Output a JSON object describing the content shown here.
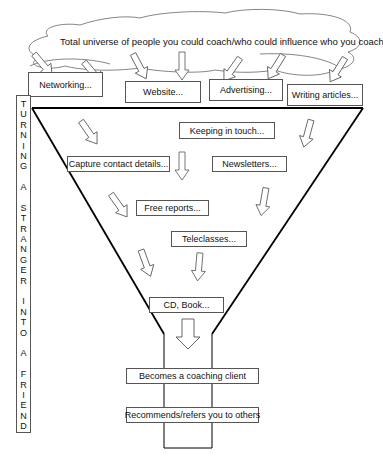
{
  "cloud": {
    "text": "Total universe of people you could coach/who could influence who you coach"
  },
  "channels": [
    {
      "label": "Networking..."
    },
    {
      "label": "Website..."
    },
    {
      "label": "Advertising..."
    },
    {
      "label": "Writing articles..."
    }
  ],
  "funnel_steps": {
    "keeping_in_touch": "Keeping in touch...",
    "capture_contact": "Capture contact details...",
    "newsletters": "Newsletters...",
    "free_reports": "Free reports...",
    "teleclasses": "Teleclasses...",
    "cd_book": "CD, Book...",
    "becomes_client": "Becomes a coaching client",
    "recommends": "Recommends/refers you to others"
  },
  "side_label": {
    "letters": [
      "T",
      "U",
      "R",
      "N",
      "I",
      "N",
      "G",
      " ",
      "A",
      " ",
      "S",
      "T",
      "R",
      "A",
      "N",
      "G",
      "E",
      "R",
      " ",
      "I",
      "N",
      "T",
      "O",
      " ",
      "A",
      " ",
      "F",
      "R",
      "I",
      "E",
      "N",
      "D"
    ]
  }
}
